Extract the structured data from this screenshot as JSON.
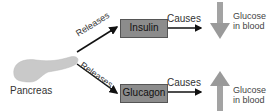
{
  "diagram": {
    "source": {
      "label": "Pancreas"
    },
    "edges": [
      {
        "from": "Pancreas",
        "to": "Insulin",
        "label": "Releases"
      },
      {
        "from": "Pancreas",
        "to": "Glucagon",
        "label": "Releases"
      },
      {
        "from": "Insulin",
        "to": "Glucose in blood (decrease)",
        "label": "Causes"
      },
      {
        "from": "Glucagon",
        "to": "Glucose in blood (increase)",
        "label": "Causes"
      }
    ],
    "hormones": [
      {
        "label": "Insulin",
        "effect_label": "Causes",
        "result_line1": "Glucose",
        "result_line2": "in blood",
        "direction": "down"
      },
      {
        "label": "Glucagon",
        "effect_label": "Causes",
        "result_line1": "Glucose",
        "result_line2": "in blood",
        "direction": "up"
      }
    ],
    "release_label": "Releases",
    "colors": {
      "box": "#8c8c8c",
      "arrow": "#111111",
      "level_arrow": "#9a9a9a",
      "pancreas": "#c9c9c9"
    }
  }
}
